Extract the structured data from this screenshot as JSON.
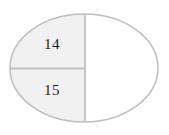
{
  "figure": {
    "name": "partitioned-ellipse",
    "type": "geometric-diagram",
    "background_color": "#ffffff",
    "canvas": {
      "width": 169,
      "height": 135
    }
  },
  "ellipse": {
    "center_x": 84,
    "center_y": 68,
    "radius_x": 74,
    "radius_y": 54,
    "stroke_color": "#bfbfbf",
    "stroke_width": 1.6,
    "fill_color": "#ffffff"
  },
  "dividers": {
    "vertical": {
      "label": "vertical-divider",
      "x": 85,
      "y_top": 14,
      "y_bottom": 122,
      "color": "#c4c4c4",
      "width": 2
    },
    "horizontal": {
      "label": "horizontal-divider",
      "y": 68,
      "x_left": 10,
      "x_right": 85,
      "color": "#c0c0c0",
      "width": 2
    }
  },
  "regions": [
    {
      "id": "upper-left",
      "label": "14",
      "fill_color": "#f1f1f1",
      "label_x": 52,
      "label_y": 46
    },
    {
      "id": "lower-left",
      "label": "15",
      "fill_color": "#f1f1f1",
      "label_x": 52,
      "label_y": 92
    },
    {
      "id": "right-half",
      "label": "",
      "fill_color": "#ffffff",
      "label_x": 122,
      "label_y": 68
    }
  ]
}
